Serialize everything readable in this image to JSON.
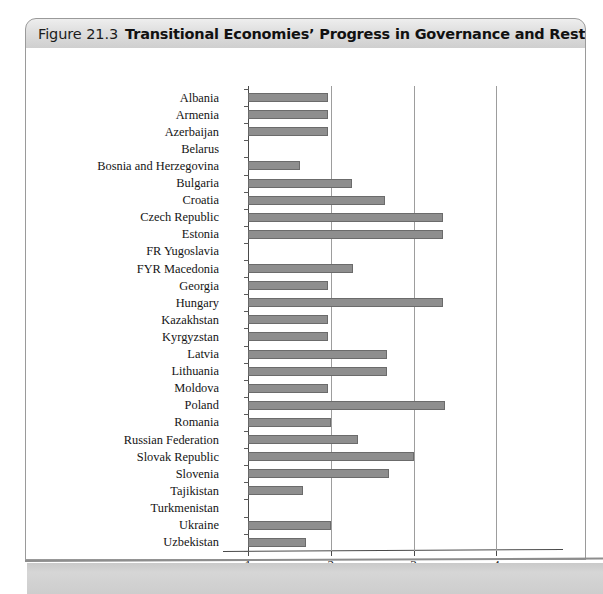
{
  "figure": {
    "number": "Figure 21.3",
    "title": "Transitional Economies’ Progress in Governance and Restructuring, 2001"
  },
  "chart_data": {
    "type": "bar",
    "orientation": "horizontal",
    "title": "Transitional Economies’ Progress in Governance and Restructuring, 2001",
    "xlabel": "Progress Index",
    "ylabel": "",
    "xlim": [
      1,
      4.35
    ],
    "xticks": [
      1,
      2,
      3,
      4
    ],
    "xtick_labels": [
      "1",
      "2",
      "3",
      "4"
    ],
    "grid": "vertical",
    "legend": "none",
    "bar_color": "#8e8e8e",
    "bar_edge_color": "#6b6b6b",
    "categories": [
      "Albania",
      "Armenia",
      "Azerbaijan",
      "Belarus",
      "Bosnia and Herzegovina",
      "Bulgaria",
      "Croatia",
      "Czech Republic",
      "Estonia",
      "FR Yugoslavia",
      "FYR Macedonia",
      "Georgia",
      "Hungary",
      "Kazakhstan",
      "Kyrgyzstan",
      "Latvia",
      "Lithuania",
      "Moldova",
      "Poland",
      "Romania",
      "Russian Federation",
      "Slovak Republic",
      "Slovenia",
      "Tajikistan",
      "Turkmenistan",
      "Ukraine",
      "Uzbekistan"
    ],
    "values": [
      1.97,
      1.97,
      1.97,
      1.0,
      1.63,
      2.25,
      2.65,
      3.35,
      3.35,
      1.0,
      2.27,
      1.97,
      3.35,
      1.97,
      1.97,
      2.68,
      2.68,
      1.97,
      3.38,
      2.0,
      2.33,
      3.0,
      2.7,
      1.66,
      1.0,
      2.0,
      1.7
    ]
  }
}
